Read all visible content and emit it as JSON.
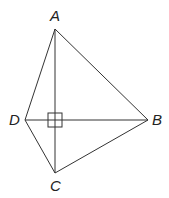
{
  "diagram": {
    "type": "geometry",
    "points": {
      "A": {
        "label": "A",
        "x": 55,
        "y": 29
      },
      "B": {
        "label": "B",
        "x": 148,
        "y": 120
      },
      "C": {
        "label": "C",
        "x": 55,
        "y": 173
      },
      "D": {
        "label": "D",
        "x": 25,
        "y": 120
      }
    },
    "segments": [
      "AB",
      "BC",
      "CD",
      "DA",
      "AC",
      "DB"
    ],
    "right_angle_marker": {
      "at": "intersection of AC and DB",
      "x": 55,
      "y": 120,
      "size": 14
    },
    "labels": {
      "A": "A",
      "B": "B",
      "C": "C",
      "D": "D"
    },
    "colors": {
      "line": "#333333",
      "text": "#222222",
      "background": "#ffffff"
    }
  }
}
